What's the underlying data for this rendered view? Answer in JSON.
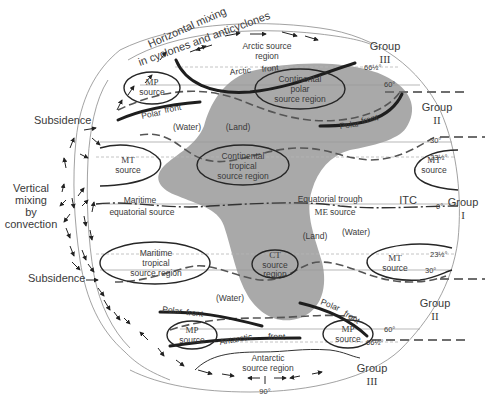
{
  "top_mixing_label": {
    "line1": "Horizontal mixing",
    "line2": "in cyclones and anticyclones"
  },
  "left_labels": {
    "subsidence_top": "Subsidence",
    "vertical_mixing": [
      "Vertical",
      "mixing",
      "by",
      "convection"
    ],
    "subsidence_bottom": "Subsidence"
  },
  "groups": [
    {
      "id": "group-iii-north",
      "label": "Group",
      "numeral": "III"
    },
    {
      "id": "group-ii-north",
      "label": "Group",
      "numeral": "II"
    },
    {
      "id": "group-i",
      "label": "Group",
      "numeral": "I"
    },
    {
      "id": "group-ii-south",
      "label": "Group",
      "numeral": "II"
    },
    {
      "id": "group-iii-south",
      "label": "Group",
      "numeral": "III"
    }
  ],
  "latitudes": {
    "n66": "66½°",
    "n60": "60°",
    "n30": "30°",
    "n23": "23½°",
    "eq": "0°",
    "s23": "23½°",
    "s30": "30°",
    "s60": "60°",
    "s66": "66½°",
    "s90": "90°"
  },
  "source_regions": {
    "arctic": [
      "Arctic source",
      "region"
    ],
    "mp_north": [
      "MP",
      "source"
    ],
    "continental_polar": [
      "Continental",
      "polar",
      "source region"
    ],
    "mt_west_north": [
      "MT",
      "source"
    ],
    "continental_tropical": [
      "Continental",
      "tropical",
      "source region"
    ],
    "mt_east_north": [
      "MT",
      "source"
    ],
    "maritime_equatorial": [
      "Maritime",
      "equatorial source"
    ],
    "me_source": [
      "ME",
      "source"
    ],
    "maritime_tropical": [
      "Maritime",
      "tropical",
      "source region"
    ],
    "ct": [
      "CT",
      "source",
      "region"
    ],
    "mt_east_south": [
      "MT",
      "source"
    ],
    "mp_south_west": [
      "MP",
      "source"
    ],
    "mp_south_east": [
      "MP",
      "source"
    ],
    "antarctic": [
      "Antarctic",
      "source region"
    ]
  },
  "fronts": {
    "arctic_front": [
      "Arctic",
      "front"
    ],
    "polar_front_nw": [
      "Polar",
      "front"
    ],
    "polar_front_ne": [
      "Polar",
      "front"
    ],
    "polar_front_sw": [
      "Polar",
      "front"
    ],
    "polar_front_se": [
      "Polar",
      "front"
    ],
    "antarctic_front": [
      "Antarctic",
      "front"
    ],
    "equatorial_trough": "Equatorial trough",
    "itc": "ITC"
  },
  "surface_labels": {
    "water_nw": "(Water)",
    "land_n": "(Land)",
    "land_s": "(Land)",
    "water_e": "(Water)",
    "water_s": "(Water)"
  },
  "colors": {
    "land": "#a9a9a9",
    "lines": "#262626",
    "text": "#3a3a3a"
  }
}
